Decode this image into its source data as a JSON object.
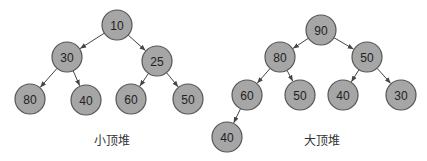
{
  "diagram": {
    "colors": {
      "node_fill": "#a6a6a6",
      "node_stroke": "#555555",
      "edge": "#444444",
      "text": "#222222"
    },
    "node_radius": 15,
    "heaps": [
      {
        "id": "min-heap",
        "caption": "小顶堆",
        "caption_pos": [
          112,
          141
        ],
        "nodes": [
          {
            "id": "m0",
            "label": "10",
            "x": 117,
            "y": 25
          },
          {
            "id": "m1",
            "label": "30",
            "x": 67,
            "y": 57
          },
          {
            "id": "m2",
            "label": "25",
            "x": 157,
            "y": 61
          },
          {
            "id": "m3",
            "label": "80",
            "x": 30,
            "y": 99
          },
          {
            "id": "m4",
            "label": "40",
            "x": 86,
            "y": 100
          },
          {
            "id": "m5",
            "label": "60",
            "x": 131,
            "y": 99
          },
          {
            "id": "m6",
            "label": "50",
            "x": 188,
            "y": 99
          }
        ],
        "edges": [
          [
            "m0",
            "m1"
          ],
          [
            "m0",
            "m2"
          ],
          [
            "m1",
            "m3"
          ],
          [
            "m1",
            "m4"
          ],
          [
            "m2",
            "m5"
          ],
          [
            "m2",
            "m6"
          ]
        ]
      },
      {
        "id": "max-heap",
        "caption": "大顶堆",
        "caption_pos": [
          322,
          141
        ],
        "nodes": [
          {
            "id": "x0",
            "label": "90",
            "x": 321,
            "y": 30
          },
          {
            "id": "x1",
            "label": "80",
            "x": 280,
            "y": 57
          },
          {
            "id": "x2",
            "label": "50",
            "x": 367,
            "y": 57
          },
          {
            "id": "x3",
            "label": "60",
            "x": 247,
            "y": 95
          },
          {
            "id": "x4",
            "label": "50",
            "x": 300,
            "y": 95
          },
          {
            "id": "x5",
            "label": "40",
            "x": 343,
            "y": 95
          },
          {
            "id": "x6",
            "label": "30",
            "x": 401,
            "y": 95
          },
          {
            "id": "x7",
            "label": "40",
            "x": 227,
            "y": 137
          }
        ],
        "edges": [
          [
            "x0",
            "x1"
          ],
          [
            "x0",
            "x2"
          ],
          [
            "x1",
            "x3"
          ],
          [
            "x1",
            "x4"
          ],
          [
            "x2",
            "x5"
          ],
          [
            "x2",
            "x6"
          ],
          [
            "x3",
            "x7"
          ]
        ]
      }
    ]
  }
}
